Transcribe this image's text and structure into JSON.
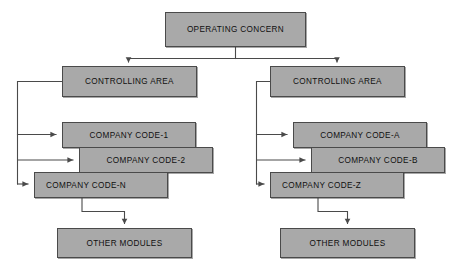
{
  "diagram": {
    "type": "organizational-hierarchy",
    "style": {
      "node_fill": "#a9a9a9",
      "node_border": "#4a4a4a",
      "connector_color": "#4a4a4a",
      "background": "#ffffff",
      "text_color": "#101010"
    },
    "nodes": [
      {
        "id": "operating-concern",
        "label": "OPERATING CONCERN",
        "level": 0,
        "x": 165,
        "y": 12,
        "w": 141,
        "h": 35,
        "align": "center"
      },
      {
        "id": "controlling-area-left",
        "label": "CONTROLLING AREA",
        "level": 1,
        "branch": "left",
        "x": 62,
        "y": 66,
        "w": 135,
        "h": 31,
        "align": "center"
      },
      {
        "id": "controlling-area-right",
        "label": "CONTROLLING AREA",
        "level": 1,
        "branch": "right",
        "x": 270,
        "y": 66,
        "w": 135,
        "h": 31,
        "align": "center"
      },
      {
        "id": "company-code-1",
        "label": "COMPANY CODE-1",
        "level": 2,
        "branch": "left",
        "x": 62,
        "y": 122,
        "w": 134,
        "h": 26,
        "align": "center"
      },
      {
        "id": "company-code-2",
        "label": "COMPANY CODE-2",
        "level": 2,
        "branch": "left",
        "x": 79,
        "y": 147,
        "w": 134,
        "h": 26,
        "align": "center"
      },
      {
        "id": "company-code-n",
        "label": "COMPANY CODE-N",
        "level": 2,
        "branch": "left",
        "x": 34,
        "y": 172,
        "w": 134,
        "h": 26,
        "align": "left"
      },
      {
        "id": "company-code-a",
        "label": "COMPANY CODE-A",
        "level": 2,
        "branch": "right",
        "x": 293,
        "y": 122,
        "w": 134,
        "h": 26,
        "align": "center"
      },
      {
        "id": "company-code-b",
        "label": "COMPANY CODE-B",
        "level": 2,
        "branch": "right",
        "x": 311,
        "y": 147,
        "w": 134,
        "h": 26,
        "align": "center"
      },
      {
        "id": "company-code-z",
        "label": "COMPANY CODE-Z",
        "level": 2,
        "branch": "right",
        "x": 270,
        "y": 172,
        "w": 134,
        "h": 26,
        "align": "left"
      },
      {
        "id": "other-modules-left",
        "label": "OTHER MODULES",
        "level": 3,
        "branch": "left",
        "x": 57,
        "y": 228,
        "w": 135,
        "h": 30,
        "align": "center"
      },
      {
        "id": "other-modules-right",
        "label": "OTHER MODULES",
        "level": 3,
        "branch": "right",
        "x": 280,
        "y": 228,
        "w": 135,
        "h": 30,
        "align": "center"
      }
    ],
    "edges": [
      {
        "from": "operating-concern",
        "to": "controlling-area-left",
        "style": "elbow-down",
        "arrow": true
      },
      {
        "from": "operating-concern",
        "to": "controlling-area-right",
        "style": "elbow-down",
        "arrow": true
      },
      {
        "from": "controlling-area-left",
        "to": "company-code-1",
        "style": "trunk-right",
        "arrow": true
      },
      {
        "from": "controlling-area-left",
        "to": "company-code-2",
        "style": "trunk-right",
        "arrow": true
      },
      {
        "from": "controlling-area-left",
        "to": "company-code-n",
        "style": "trunk-right",
        "arrow": true
      },
      {
        "from": "controlling-area-right",
        "to": "company-code-a",
        "style": "trunk-right",
        "arrow": true
      },
      {
        "from": "controlling-area-right",
        "to": "company-code-b",
        "style": "trunk-right",
        "arrow": true
      },
      {
        "from": "controlling-area-right",
        "to": "company-code-z",
        "style": "trunk-right",
        "arrow": true
      },
      {
        "from": "company-code-n",
        "to": "other-modules-left",
        "style": "elbow-down",
        "arrow": true
      },
      {
        "from": "company-code-z",
        "to": "other-modules-right",
        "style": "elbow-down",
        "arrow": true
      }
    ]
  }
}
